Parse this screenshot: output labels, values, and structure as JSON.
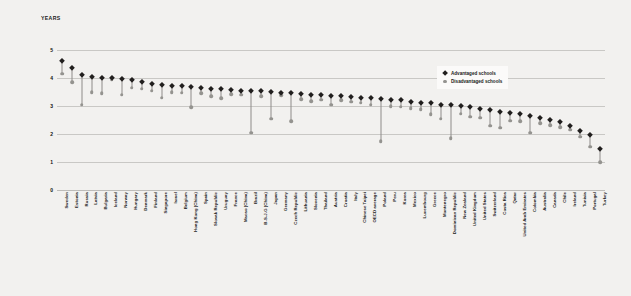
{
  "chart_data": {
    "type": "scatter",
    "title": "",
    "subtitle": "",
    "xlabel": "",
    "ylabel": "YEARS",
    "ylim": [
      0,
      5
    ],
    "yticks": [
      5,
      4,
      3,
      2,
      1,
      0
    ],
    "grid": true,
    "legend_position": "top-right",
    "legend": [
      {
        "name": "Advantaged schools",
        "marker": "diamond",
        "color": "#211f1e"
      },
      {
        "name": "Disadvantaged schools",
        "marker": "circle",
        "color": "#94938f"
      }
    ],
    "categories": [
      "Sweden",
      "Estonia",
      "Russia",
      "Latvia",
      "Bulgaria",
      "Iceland",
      "Norway",
      "Hungary",
      "Denmark",
      "Finland",
      "Singapore",
      "Israel",
      "Belgium",
      "Hong Kong (China)",
      "Spain",
      "Slovak Republic",
      "Uruguay",
      "France",
      "Macao (China)",
      "Brazil",
      "B-S-J-G (China)",
      "Japan",
      "Germany",
      "Czech Republic",
      "Lithuania",
      "Slovenia",
      "Thailand",
      "Austria",
      "Croatia",
      "Italy",
      "Chinese Taipei",
      "OECD average",
      "Poland",
      "Peru",
      "Korea",
      "Mexico",
      "Luxembourg",
      "Greece",
      "Montenegro",
      "Dominican Republic",
      "New Zealand",
      "United Kingdom",
      "United States",
      "Switzerland",
      "Costa Rica",
      "Qatar",
      "United Arab Emirates",
      "Colombia",
      "Australia",
      "Canada",
      "Chile",
      "Ireland",
      "Tunisia",
      "Portugal",
      "Turkey"
    ],
    "series": [
      {
        "name": "Advantaged schools",
        "marker": "diamond",
        "color": "#211f1e",
        "values": [
          4.6,
          4.35,
          4.1,
          4.05,
          4.0,
          4.0,
          3.95,
          3.92,
          3.85,
          3.8,
          3.75,
          3.72,
          3.7,
          3.68,
          3.65,
          3.62,
          3.6,
          3.58,
          3.55,
          3.55,
          3.52,
          3.5,
          3.48,
          3.45,
          3.42,
          3.4,
          3.38,
          3.36,
          3.34,
          3.32,
          3.3,
          3.28,
          3.25,
          3.22,
          3.2,
          3.15,
          3.12,
          3.1,
          3.05,
          3.02,
          3.0,
          2.95,
          2.9,
          2.85,
          2.8,
          2.75,
          2.7,
          2.65,
          2.58,
          2.5,
          2.42,
          2.3,
          2.1,
          1.95,
          1.45
        ]
      },
      {
        "name": "Disadvantaged schools",
        "marker": "circle",
        "color": "#94938f",
        "values": [
          4.15,
          3.85,
          3.05,
          3.5,
          3.45,
          3.95,
          3.4,
          3.65,
          3.62,
          3.55,
          3.3,
          3.5,
          3.48,
          2.95,
          3.45,
          3.35,
          3.28,
          3.42,
          3.4,
          2.05,
          3.35,
          2.55,
          3.38,
          2.45,
          3.25,
          3.18,
          3.22,
          3.05,
          3.2,
          3.15,
          3.12,
          3.05,
          1.75,
          3.0,
          2.98,
          2.92,
          2.88,
          2.7,
          2.55,
          1.85,
          2.72,
          2.62,
          2.58,
          2.3,
          2.22,
          2.48,
          2.45,
          2.05,
          2.38,
          2.32,
          2.25,
          2.15,
          1.9,
          1.55,
          1.0
        ]
      }
    ]
  }
}
